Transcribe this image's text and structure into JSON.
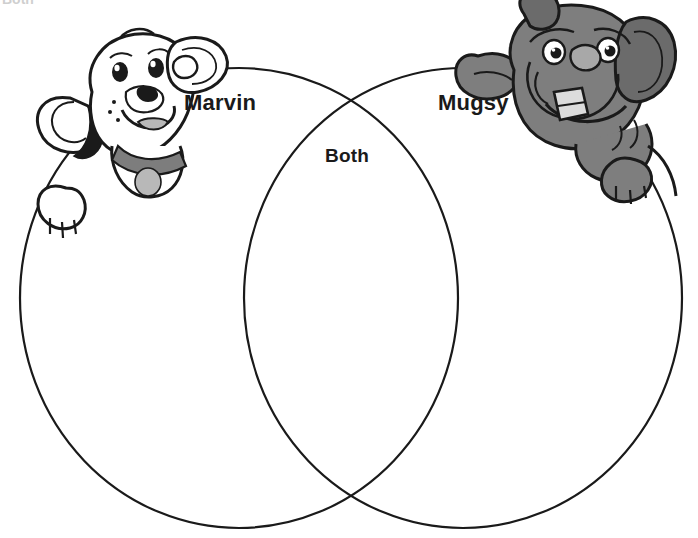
{
  "page": {
    "type": "venn-diagram-worksheet",
    "background_color": "#ffffff",
    "width": 698,
    "height": 538,
    "clipped_header_text": "Both"
  },
  "diagram": {
    "outline_color": "#1a1a1a",
    "outline_width": 2.2,
    "fill": "none",
    "left_circle": {
      "cx": 239,
      "cy": 298,
      "rx": 219,
      "ry": 230
    },
    "right_circle": {
      "cx": 463,
      "cy": 298,
      "rx": 219,
      "ry": 230
    }
  },
  "labels": {
    "left": "Marvin",
    "right": "Mugsy",
    "overlap": "Both"
  },
  "illustrations": {
    "left_dog": {
      "name": "Marvin",
      "breed_look": "white floppy-eared puppy",
      "body_color": "#ffffff",
      "outline_color": "#1a1a1a",
      "collar_color": "#7d7d7d",
      "tag_color": "#b8b8b8",
      "spot_color": "#1a1a1a"
    },
    "right_dog": {
      "name": "Mugsy",
      "breed_look": "gray bulldog with underbite tooth",
      "body_color": "#7e7e7e",
      "shade_color": "#6b6b6b",
      "outline_color": "#1a1a1a",
      "tooth_color": "#dcdcdc",
      "nose_color": "#a8a8a8"
    }
  }
}
